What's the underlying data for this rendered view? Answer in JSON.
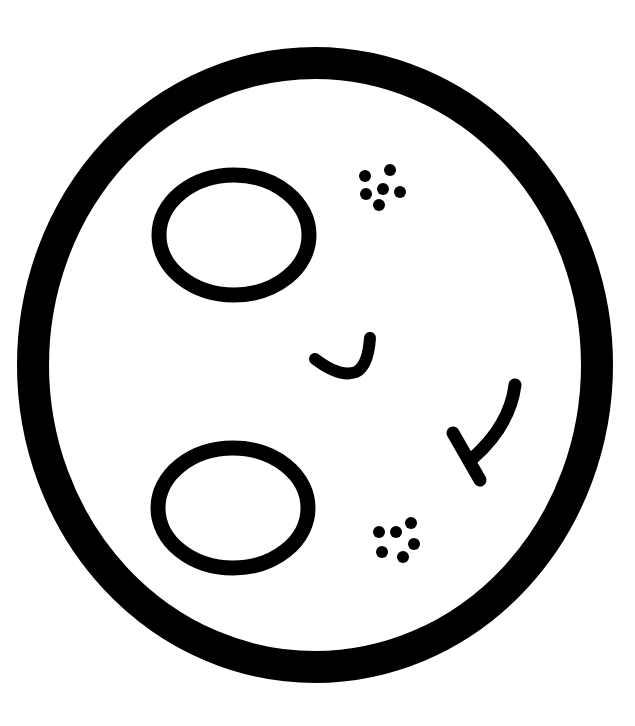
{
  "illustration": {
    "subject": "face-outline-icon",
    "background_color": "#ffffff",
    "line_color": "#000000",
    "head": {
      "cx": 315,
      "cy": 365,
      "rx": 282,
      "ry": 302,
      "stroke_width": 32
    },
    "eyes": [
      {
        "name": "upper-eye",
        "cx": 234,
        "cy": 235,
        "rx": 75,
        "ry": 60,
        "stroke_width": 15
      },
      {
        "name": "lower-eye",
        "cx": 233,
        "cy": 508,
        "rx": 75,
        "ry": 60,
        "stroke_width": 15
      }
    ],
    "freckle_clusters": [
      {
        "name": "upper-freckles",
        "dot_radius": 6,
        "dots": [
          [
            365,
            176
          ],
          [
            390,
            170
          ],
          [
            366,
            194
          ],
          [
            383,
            189
          ],
          [
            400,
            192
          ],
          [
            379,
            205
          ]
        ]
      },
      {
        "name": "lower-freckles",
        "dot_radius": 6,
        "dots": [
          [
            379,
            532
          ],
          [
            396,
            532
          ],
          [
            411,
            523
          ],
          [
            414,
            544
          ],
          [
            382,
            552
          ],
          [
            403,
            557
          ]
        ]
      }
    ],
    "smile_stroke": {
      "path": "M315 359 Q340 378 356 372 Q368 366 370 338",
      "stroke_width": 12
    },
    "nose_check_stroke": {
      "curve_path": "M515 385 Q510 425 473 458",
      "tick_path": "M453 433 L480 480",
      "stroke_width": 13
    }
  }
}
